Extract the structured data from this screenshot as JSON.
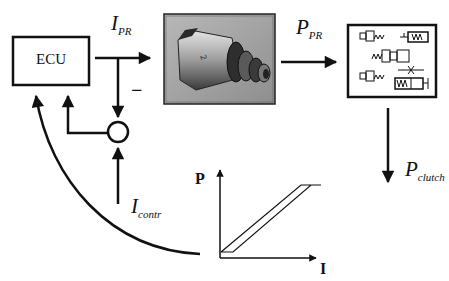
{
  "diagram": {
    "blocks": {
      "ecu": {
        "label": "ECU"
      },
      "solenoid": {
        "label": "pressure regulator solenoid (photo)",
        "icon": "solenoid-photo"
      },
      "hydraulics": {
        "label": "hydraulic valve schematic",
        "icon": "hydraulic-valves-icon"
      },
      "summing_junction": {
        "label": "summing junction",
        "sign": "−"
      }
    },
    "signals": {
      "i_pr": {
        "main": "I",
        "sub": "PR"
      },
      "p_pr": {
        "main": "P",
        "sub": "PR"
      },
      "p_clutch": {
        "main": "P",
        "sub": "clutch"
      },
      "i_contr": {
        "main": "I",
        "sub": "contr"
      }
    },
    "characteristic_plot": {
      "x_axis": "I",
      "y_axis": "P",
      "shape": "hysteresis band (linear ramp with saturation)"
    },
    "colors": {
      "line": "#111111",
      "background": "#ffffff",
      "photo_bg": "#8a8a8a"
    }
  }
}
